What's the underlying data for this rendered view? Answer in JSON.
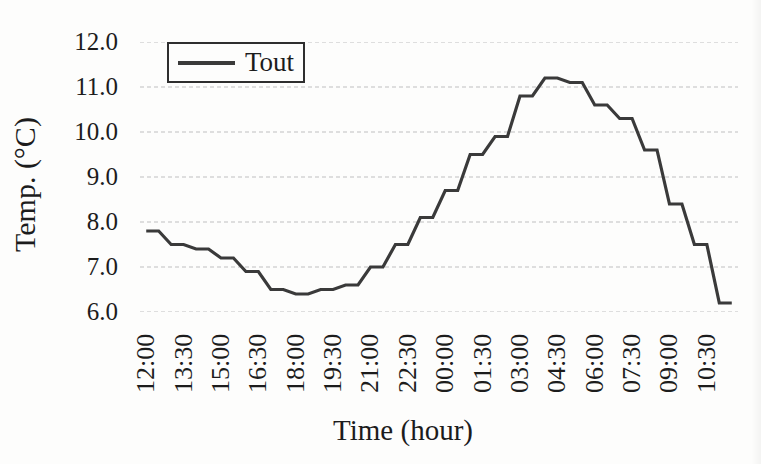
{
  "figure": {
    "kind": "scanned line chart"
  },
  "legend": {
    "label": "Tout",
    "position": "top-left-inside"
  },
  "chart_data": {
    "type": "line",
    "title": "",
    "x_label": "Time (hour)",
    "y_label": "Temp. (°C)",
    "x": [
      "12:00",
      "12:30",
      "13:00",
      "13:30",
      "14:00",
      "14:30",
      "15:00",
      "15:30",
      "16:00",
      "16:30",
      "17:00",
      "17:30",
      "18:00",
      "18:30",
      "19:00",
      "19:30",
      "20:00",
      "20:30",
      "21:00",
      "21:30",
      "22:00",
      "22:30",
      "23:00",
      "23:30",
      "00:00",
      "00:30",
      "01:00",
      "01:30",
      "02:00",
      "02:30",
      "03:00",
      "03:30",
      "04:00",
      "04:30",
      "05:00",
      "05:30",
      "06:00",
      "06:30",
      "07:00",
      "07:30",
      "08:00",
      "08:30",
      "09:00",
      "09:30",
      "10:00",
      "10:30",
      "11:00",
      "11:30"
    ],
    "x_tick_every": 3,
    "x_tick_labels": [
      "12:00",
      "13:30",
      "15:00",
      "16:30",
      "18:00",
      "19:30",
      "21:00",
      "22:30",
      "00:00",
      "01:30",
      "03:00",
      "04:30",
      "06:00",
      "07:30",
      "09:00",
      "10:30"
    ],
    "series": [
      {
        "name": "Tout",
        "color": "#3a3a3a",
        "values": [
          7.8,
          7.8,
          7.5,
          7.5,
          7.4,
          7.4,
          7.2,
          7.2,
          6.9,
          6.9,
          6.5,
          6.5,
          6.4,
          6.4,
          6.5,
          6.5,
          6.6,
          6.6,
          7.0,
          7.0,
          7.5,
          7.5,
          8.1,
          8.1,
          8.7,
          8.7,
          9.5,
          9.5,
          9.9,
          9.9,
          10.8,
          10.8,
          11.2,
          11.2,
          11.1,
          11.1,
          10.6,
          10.6,
          10.3,
          10.3,
          9.6,
          9.6,
          8.4,
          8.4,
          7.5,
          7.5,
          6.2,
          6.2
        ]
      }
    ],
    "ylim": [
      6.0,
      12.0
    ],
    "y_ticks": [
      6.0,
      7.0,
      8.0,
      9.0,
      10.0,
      11.0,
      12.0
    ],
    "grid": "horizontal-dashed",
    "grid_color": "#bfbfbf",
    "legend_position": "top-left-inside"
  }
}
